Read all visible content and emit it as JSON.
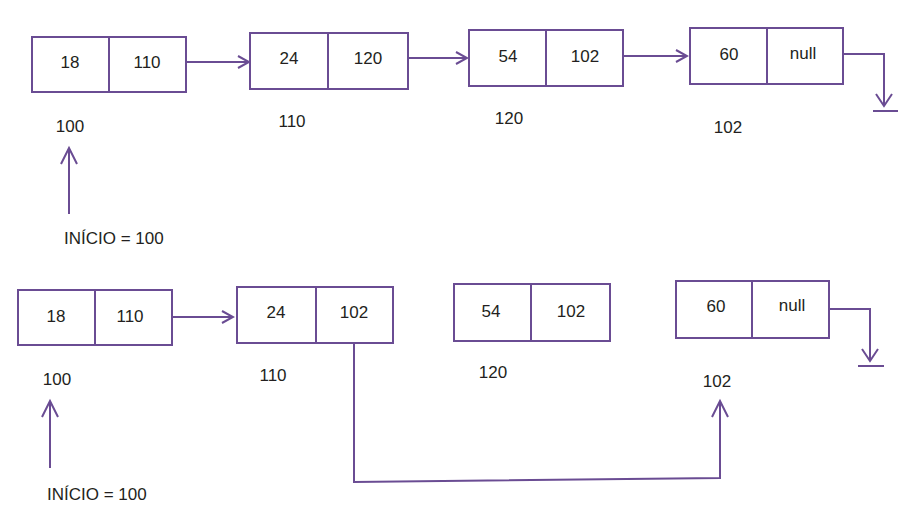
{
  "colors": {
    "line": "#6a4c93",
    "text": "#231f20",
    "background": "#ffffff"
  },
  "diagrams": [
    {
      "name": "original-list",
      "nodes": [
        {
          "value": "18",
          "next": "110",
          "address": "100"
        },
        {
          "value": "24",
          "next": "120",
          "address": "110"
        },
        {
          "value": "54",
          "next": "102",
          "address": "120"
        },
        {
          "value": "60",
          "next": "null",
          "address": "102"
        }
      ],
      "start_label": "INÍCIO = 100",
      "links": [
        "0->1",
        "1->2",
        "2->3",
        "3->ground"
      ]
    },
    {
      "name": "after-removal",
      "nodes": [
        {
          "value": "18",
          "next": "110",
          "address": "100"
        },
        {
          "value": "24",
          "next": "102",
          "address": "110"
        },
        {
          "value": "54",
          "next": "102",
          "address": "120"
        },
        {
          "value": "60",
          "next": "null",
          "address": "102"
        }
      ],
      "start_label": "INÍCIO = 100",
      "links": [
        "0->1",
        "1->3 (bypass)",
        "3->ground"
      ]
    }
  ]
}
